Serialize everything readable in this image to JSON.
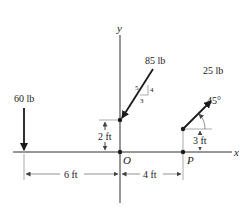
{
  "figure": {
    "axes": {
      "x_label": "x",
      "y_label": "y"
    },
    "points": {
      "origin": "O",
      "p": "P"
    },
    "forces": [
      {
        "id": "f60",
        "label": "60 lb",
        "direction": "down"
      },
      {
        "id": "f85",
        "label": "85 lb",
        "slope": {
          "hyp": "5",
          "rise": "4",
          "run": "3"
        }
      },
      {
        "id": "f25",
        "label": "25 lb",
        "angle": "45°"
      }
    ],
    "dimensions": {
      "d_85_height": "2 ft",
      "d_25_height": "3 ft",
      "d_left": "6 ft",
      "d_right": "4 ft"
    },
    "colors": {
      "line": "#1a1a1a",
      "dim": "#555555",
      "background": "#ffffff"
    }
  }
}
